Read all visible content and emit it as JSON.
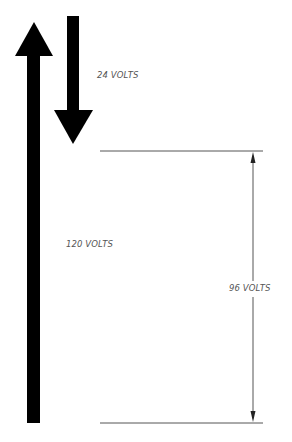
{
  "diagram": {
    "labels": {
      "source_voltage": "120 VOLTS",
      "drop_voltage": "24 VOLTS",
      "difference_voltage": "96 VOLTS"
    },
    "colors": {
      "arrow": "#000000",
      "line": "#555555",
      "text": "#555555",
      "background": "#ffffff"
    }
  }
}
